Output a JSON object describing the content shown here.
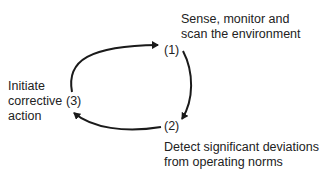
{
  "diagram": {
    "title_cutoff": "",
    "nodes": [
      {
        "id": "1",
        "label": "(1)",
        "description_lines": [
          "Sense, monitor and",
          "scan the environment"
        ]
      },
      {
        "id": "2",
        "label": "(2)",
        "description_lines": [
          "Detect significant deviations",
          "from operating norms"
        ]
      },
      {
        "id": "3",
        "label": "(3)",
        "description_lines": [
          "Initiate",
          "corrective",
          "action"
        ]
      }
    ],
    "edges": [
      {
        "from": "3",
        "to": "1"
      },
      {
        "from": "1",
        "to": "2"
      },
      {
        "from": "2",
        "to": "3"
      }
    ],
    "colors": {
      "stroke": "#1a1a1a",
      "text": "#222222",
      "background": "#ffffff"
    }
  }
}
